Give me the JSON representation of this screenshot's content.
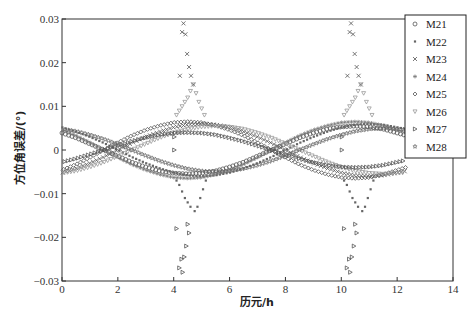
{
  "chart_data": {
    "type": "scatter",
    "title": "",
    "xlabel": "历元/h",
    "ylabel": "方位角误差/(°)",
    "xlim": [
      0,
      14
    ],
    "ylim": [
      -0.03,
      0.03
    ],
    "xticks": [
      0,
      2,
      4,
      6,
      8,
      10,
      12,
      14
    ],
    "xtick_labels": [
      "0",
      "2",
      "4",
      "6",
      "8",
      "10",
      "12",
      "14"
    ],
    "yticks": [
      -0.03,
      -0.02,
      -0.01,
      0,
      0.01,
      0.02,
      0.03
    ],
    "ytick_labels": [
      "-0.03",
      "-0.02",
      "-0.01",
      "0",
      "0.01",
      "0.02",
      "0.03"
    ],
    "grid": false,
    "legend_position": "upper right (outside plot edge)",
    "x": [
      0,
      0.5,
      1,
      1.5,
      2,
      2.5,
      3,
      3.5,
      4,
      4.5,
      5,
      5.5,
      6,
      6.5,
      7,
      7.5,
      8,
      8.5,
      9,
      9.5,
      10,
      10.5,
      11,
      11.5,
      12
    ],
    "series": [
      {
        "name": "M21",
        "marker": "circle",
        "color": "#555555",
        "values": [
          0.0039,
          0.0028,
          0.0014,
          0,
          -0.0014,
          -0.0028,
          -0.0039,
          -0.0048,
          -0.0053,
          -0.0055,
          -0.0053,
          -0.0048,
          -0.0039,
          -0.0028,
          -0.0014,
          0,
          0.0014,
          0.0028,
          0.0039,
          0.0048,
          0.0053,
          0.0055,
          0.0053,
          0.0048,
          0.0039
        ],
        "extra_points": []
      },
      {
        "name": "M22",
        "marker": "square-dot",
        "color": "#666666",
        "values": [
          0.0052,
          0.0042,
          0.003,
          0.0016,
          0,
          -0.0016,
          -0.003,
          -0.0042,
          -0.0052,
          -0.0058,
          -0.006,
          -0.0058,
          -0.0052,
          -0.0042,
          -0.003,
          -0.0016,
          0,
          0.0016,
          0.003,
          0.0042,
          0.0052,
          0.0058,
          0.006,
          0.0058,
          0.0052
        ],
        "extra_points": [
          [
            4.1,
            -0.007
          ],
          [
            4.2,
            -0.008
          ],
          [
            4.3,
            -0.0095
          ],
          [
            4.4,
            -0.011
          ],
          [
            4.5,
            -0.012
          ],
          [
            4.6,
            -0.013
          ],
          [
            4.75,
            -0.014
          ],
          [
            4.85,
            -0.013
          ],
          [
            4.95,
            -0.011
          ],
          [
            5.05,
            -0.009
          ],
          [
            5.15,
            -0.007
          ],
          [
            10.1,
            -0.007
          ],
          [
            10.2,
            -0.008
          ],
          [
            10.3,
            -0.0095
          ],
          [
            10.4,
            -0.011
          ],
          [
            10.5,
            -0.012
          ],
          [
            10.6,
            -0.013
          ],
          [
            10.75,
            -0.014
          ],
          [
            10.85,
            -0.013
          ],
          [
            10.95,
            -0.011
          ],
          [
            11.05,
            -0.009
          ],
          [
            11.15,
            -0.007
          ]
        ]
      },
      {
        "name": "M23",
        "marker": "x",
        "color": "#555555",
        "values": [
          -0.0052,
          -0.0042,
          -0.003,
          -0.0016,
          0,
          0.0016,
          0.003,
          0.0042,
          0.0052,
          0.0058,
          0.006,
          0.0058,
          0.0052,
          0.0042,
          0.003,
          0.0016,
          0,
          -0.0016,
          -0.003,
          -0.0042,
          -0.0052,
          -0.0058,
          -0.006,
          -0.0058,
          -0.0052
        ],
        "extra_points": [
          [
            4.35,
            0.029
          ],
          [
            4.3,
            0.027
          ],
          [
            4.42,
            0.0265
          ],
          [
            4.48,
            0.022
          ],
          [
            4.55,
            0.019
          ],
          [
            4.22,
            0.017
          ],
          [
            4.62,
            0.017
          ],
          [
            4.7,
            0.015
          ],
          [
            10.35,
            0.029
          ],
          [
            10.3,
            0.027
          ],
          [
            10.42,
            0.0265
          ],
          [
            10.48,
            0.022
          ],
          [
            10.55,
            0.019
          ],
          [
            10.22,
            0.017
          ],
          [
            10.62,
            0.017
          ],
          [
            10.7,
            0.015
          ]
        ]
      },
      {
        "name": "M24",
        "marker": "asterisk",
        "color": "#777777",
        "values": [
          0.0046,
          0.0033,
          0.0017,
          0,
          -0.0017,
          -0.0033,
          -0.0046,
          -0.0056,
          -0.0063,
          -0.0065,
          -0.0063,
          -0.0056,
          -0.0046,
          -0.0033,
          -0.0017,
          0,
          0.0017,
          0.0033,
          0.0046,
          0.0056,
          0.0063,
          0.0065,
          0.0063,
          0.0056,
          0.0046
        ],
        "extra_points": []
      },
      {
        "name": "M25",
        "marker": "diamond",
        "color": "#555555",
        "values": [
          -0.0046,
          -0.0033,
          -0.0017,
          0,
          0.0017,
          0.0033,
          0.0046,
          0.0056,
          0.0063,
          0.0065,
          0.0063,
          0.0056,
          0.0046,
          0.0033,
          0.0017,
          0,
          -0.0017,
          -0.0033,
          -0.0046,
          -0.0056,
          -0.0063,
          -0.0065,
          -0.0063,
          -0.0056,
          -0.0046
        ],
        "extra_points": []
      },
      {
        "name": "M26",
        "marker": "triangle-down",
        "color": "#999999",
        "values": [
          -0.0053,
          -0.0048,
          -0.0039,
          -0.0028,
          -0.0014,
          0,
          0.0014,
          0.0028,
          0.0039,
          0.0048,
          0.0053,
          0.0055,
          0.0053,
          0.0048,
          0.0039,
          0.0028,
          0.0014,
          0,
          -0.0014,
          -0.0028,
          -0.0039,
          -0.0048,
          -0.0053,
          -0.0055,
          -0.0053
        ],
        "extra_points": [
          [
            4.1,
            0.008
          ],
          [
            4.2,
            0.009
          ],
          [
            4.3,
            0.01
          ],
          [
            4.4,
            0.011
          ],
          [
            4.5,
            0.012
          ],
          [
            4.6,
            0.0135
          ],
          [
            4.7,
            0.015
          ],
          [
            4.8,
            0.013
          ],
          [
            4.9,
            0.011
          ],
          [
            5.0,
            0.0095
          ],
          [
            5.1,
            0.008
          ],
          [
            10.1,
            0.008
          ],
          [
            10.2,
            0.009
          ],
          [
            10.3,
            0.01
          ],
          [
            10.4,
            0.011
          ],
          [
            10.5,
            0.012
          ],
          [
            10.6,
            0.0135
          ],
          [
            10.7,
            0.015
          ],
          [
            10.8,
            0.013
          ],
          [
            10.9,
            0.011
          ],
          [
            11.0,
            0.0095
          ],
          [
            11.1,
            0.008
          ]
        ]
      },
      {
        "name": "M27",
        "marker": "triangle-right",
        "color": "#555555",
        "values": [
          -0.0028,
          -0.002,
          -0.001,
          0,
          0.001,
          0.002,
          0.0028,
          0.0035,
          0.0039,
          0.004,
          0.0039,
          0.0035,
          0.0028,
          0.002,
          0.001,
          0,
          -0.001,
          -0.002,
          -0.0028,
          -0.0035,
          -0.0039,
          -0.004,
          -0.0039,
          -0.0035,
          -0.0028
        ],
        "extra_points": [
          [
            4.02,
            0.003
          ],
          [
            4.02,
            0.0
          ],
          [
            4.5,
            -0.017
          ],
          [
            4.55,
            -0.019
          ],
          [
            4.45,
            -0.022
          ],
          [
            4.28,
            -0.025
          ],
          [
            4.38,
            -0.0245
          ],
          [
            4.2,
            -0.027
          ],
          [
            4.32,
            -0.028
          ],
          [
            4.1,
            -0.018
          ],
          [
            10.02,
            0.003
          ],
          [
            10.02,
            0.0
          ],
          [
            10.5,
            -0.017
          ],
          [
            10.55,
            -0.019
          ],
          [
            10.45,
            -0.022
          ],
          [
            10.28,
            -0.025
          ],
          [
            10.38,
            -0.0245
          ],
          [
            10.2,
            -0.027
          ],
          [
            10.32,
            -0.028
          ],
          [
            10.1,
            -0.018
          ]
        ]
      },
      {
        "name": "M28",
        "marker": "star",
        "color": "#666666",
        "values": [
          0.0048,
          0.0043,
          0.0035,
          0.0025,
          0.0013,
          0,
          -0.0013,
          -0.0025,
          -0.0035,
          -0.0043,
          -0.0048,
          -0.005,
          -0.0048,
          -0.0043,
          -0.0035,
          -0.0025,
          -0.0013,
          0,
          0.0013,
          0.0025,
          0.0035,
          0.0043,
          0.0048,
          0.005,
          0.0048
        ],
        "extra_points": []
      }
    ]
  },
  "axes": {
    "xlabel": "历元/h",
    "ylabel": "方位角误差/(°)"
  },
  "legend": {
    "items": [
      {
        "label": "M21",
        "marker": "circle"
      },
      {
        "label": "M22",
        "marker": "square-dot"
      },
      {
        "label": "M23",
        "marker": "x"
      },
      {
        "label": "M24",
        "marker": "asterisk"
      },
      {
        "label": "M25",
        "marker": "diamond"
      },
      {
        "label": "M26",
        "marker": "triangle-down"
      },
      {
        "label": "M27",
        "marker": "triangle-right"
      },
      {
        "label": "M28",
        "marker": "star"
      }
    ]
  }
}
